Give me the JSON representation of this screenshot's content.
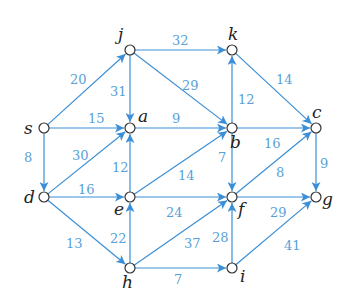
{
  "diagram": {
    "type": "directed-weighted-graph",
    "edge_color": "#3a8fd6",
    "label_color": "#5a9fd8",
    "nodes": [
      {
        "id": "s",
        "label": "s",
        "x": 44,
        "y": 128,
        "lx": 24,
        "ly": 134
      },
      {
        "id": "j",
        "label": "j",
        "x": 130,
        "y": 50,
        "lx": 118,
        "ly": 40
      },
      {
        "id": "k",
        "label": "k",
        "x": 232,
        "y": 50,
        "lx": 228,
        "ly": 40
      },
      {
        "id": "a",
        "label": "a",
        "x": 130,
        "y": 128,
        "lx": 138,
        "ly": 122
      },
      {
        "id": "b",
        "label": "b",
        "x": 232,
        "y": 128,
        "lx": 230,
        "ly": 148
      },
      {
        "id": "c",
        "label": "c",
        "x": 316,
        "y": 128,
        "lx": 312,
        "ly": 118
      },
      {
        "id": "d",
        "label": "d",
        "x": 44,
        "y": 197,
        "lx": 24,
        "ly": 203
      },
      {
        "id": "e",
        "label": "e",
        "x": 130,
        "y": 197,
        "lx": 114,
        "ly": 215
      },
      {
        "id": "f",
        "label": "f",
        "x": 232,
        "y": 197,
        "lx": 238,
        "ly": 215
      },
      {
        "id": "g",
        "label": "g",
        "x": 316,
        "y": 197,
        "lx": 322,
        "ly": 205
      },
      {
        "id": "h",
        "label": "h",
        "x": 130,
        "y": 268,
        "lx": 122,
        "ly": 288
      },
      {
        "id": "i",
        "label": "i",
        "x": 232,
        "y": 268,
        "lx": 240,
        "ly": 282
      }
    ],
    "edges": [
      {
        "from": "s",
        "to": "j",
        "weight": "20",
        "lx": 70,
        "ly": 84
      },
      {
        "from": "s",
        "to": "a",
        "weight": "15",
        "lx": 88,
        "ly": 123
      },
      {
        "from": "s",
        "to": "d",
        "weight": "8",
        "lx": 24,
        "ly": 162
      },
      {
        "from": "j",
        "to": "k",
        "weight": "32",
        "lx": 172,
        "ly": 45
      },
      {
        "from": "j",
        "to": "a",
        "weight": "31",
        "lx": 110,
        "ly": 96
      },
      {
        "from": "j",
        "to": "b",
        "weight": "29",
        "lx": 182,
        "ly": 90
      },
      {
        "from": "a",
        "to": "b",
        "weight": "9",
        "lx": 172,
        "ly": 123
      },
      {
        "from": "b",
        "to": "k",
        "weight": "12",
        "lx": 238,
        "ly": 104
      },
      {
        "from": "k",
        "to": "c",
        "weight": "14",
        "lx": 276,
        "ly": 84
      },
      {
        "from": "b",
        "to": "c",
        "weight": "16",
        "lx": 264,
        "ly": 148
      },
      {
        "from": "b",
        "to": "f",
        "weight": "7",
        "lx": 218,
        "ly": 162
      },
      {
        "from": "c",
        "to": "g",
        "weight": "9",
        "lx": 320,
        "ly": 168
      },
      {
        "from": "d",
        "to": "a",
        "weight": "30",
        "lx": 72,
        "ly": 160
      },
      {
        "from": "d",
        "to": "e",
        "weight": "16",
        "lx": 78,
        "ly": 194
      },
      {
        "from": "d",
        "to": "h",
        "weight": "13",
        "lx": 66,
        "ly": 248
      },
      {
        "from": "e",
        "to": "a",
        "weight": "12",
        "lx": 112,
        "ly": 172
      },
      {
        "from": "e",
        "to": "b",
        "weight": "14",
        "lx": 178,
        "ly": 180
      },
      {
        "from": "e",
        "to": "f",
        "weight": "24",
        "lx": 166,
        "ly": 217
      },
      {
        "from": "f",
        "to": "c",
        "weight": "8",
        "lx": 276,
        "ly": 177
      },
      {
        "from": "f",
        "to": "g",
        "weight": "29",
        "lx": 270,
        "ly": 217
      },
      {
        "from": "h",
        "to": "e",
        "weight": "22",
        "lx": 110,
        "ly": 243
      },
      {
        "from": "h",
        "to": "f",
        "weight": "37",
        "lx": 184,
        "ly": 248
      },
      {
        "from": "h",
        "to": "i",
        "weight": "7",
        "lx": 174,
        "ly": 284
      },
      {
        "from": "i",
        "to": "f",
        "weight": "28",
        "lx": 212,
        "ly": 242
      },
      {
        "from": "i",
        "to": "g",
        "weight": "41",
        "lx": 284,
        "ly": 250
      }
    ]
  }
}
